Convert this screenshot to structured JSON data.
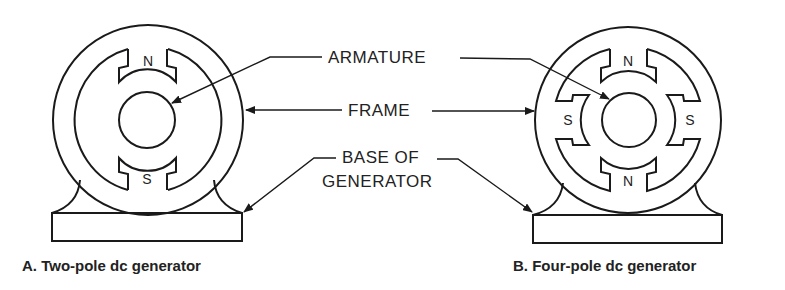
{
  "figure": {
    "labels": {
      "armature": "ARMATURE",
      "frame": "FRAME",
      "base_line1": "BASE OF",
      "base_line2": "GENERATOR"
    },
    "two_pole": {
      "caption": "A.  Two-pole dc generator",
      "poles": [
        "N",
        "S"
      ]
    },
    "four_pole": {
      "caption": "B.  Four-pole dc generator",
      "poles": [
        "N",
        "S",
        "S",
        "N"
      ]
    },
    "colors": {
      "ink": "#1a1a1a",
      "background": "#ffffff"
    }
  }
}
